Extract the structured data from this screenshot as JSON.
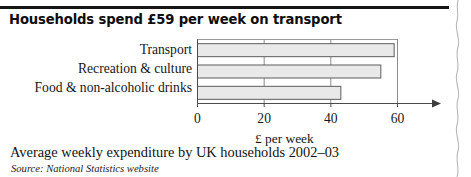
{
  "headline": "Households spend £59 per week on transport",
  "caption": "Average weekly expenditure by UK households 2002–03",
  "source": "Source: National Statistics website",
  "axis_title": "£ per week",
  "ticks": [
    {
      "label": "0",
      "value": 0
    },
    {
      "label": "20",
      "value": 20
    },
    {
      "label": "40",
      "value": 40
    },
    {
      "label": "60",
      "value": 60
    }
  ],
  "colors": {
    "bar_fill": "#e9e9e9",
    "bar_stroke": "#5d5d5d",
    "axis": "#4a4a4a",
    "grid": "#8c8c8c",
    "rule": "#151515",
    "text": "#161616",
    "background": "#ffffff"
  },
  "chart_data": {
    "type": "bar",
    "orientation": "horizontal",
    "title": "Households spend £59 per week on transport",
    "subtitle": "Average weekly expenditure by UK households 2002–03",
    "categories": [
      "Transport",
      "Recreation & culture",
      "Food & non-alcoholic drinks"
    ],
    "values": [
      59,
      55,
      43
    ],
    "xlabel": "£ per week",
    "ylabel": "",
    "xlim": [
      0,
      60
    ],
    "xticks": [
      0,
      20,
      40,
      60
    ],
    "grid": true,
    "legend": false,
    "source": "Source: National Statistics website"
  }
}
